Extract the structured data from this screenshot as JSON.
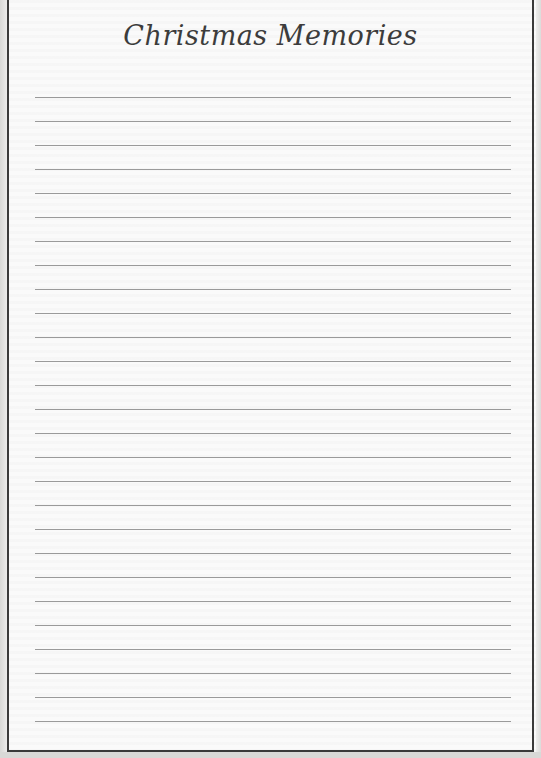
{
  "page": {
    "title": "Christmas Memories",
    "line_count": 27,
    "colors": {
      "border": "#3a3a3a",
      "rule": "#9a9a9a",
      "title": "#3c3c3c",
      "paper": "#fafafa"
    }
  }
}
